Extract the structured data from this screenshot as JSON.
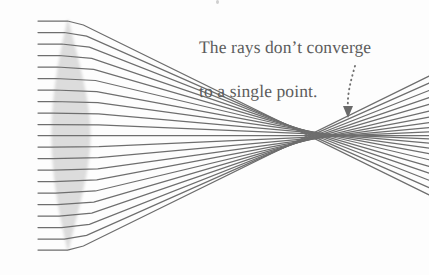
{
  "figure": {
    "annotation": {
      "line1": "The rays don’t converge",
      "line2": "to a single point.",
      "color": "#5c5c5c",
      "pointer_icon": "dotted-curved-arrow-icon"
    },
    "background_color": "#fdfdfd",
    "ray_color": "#6e6e6e",
    "lens_fill_color": "#dcdcdc",
    "lens_edge_color": "#c8c8c8",
    "width": 429,
    "height": 275
  },
  "chart_data": {
    "type": "scatter",
    "xlabel": "",
    "ylabel": "",
    "xlim": [
      0,
      429
    ],
    "ylim": [
      275,
      0
    ],
    "grid": false,
    "legend": null,
    "annotations": [
      {
        "text": "The rays don’t converge to a single point.",
        "x": 199,
        "y": 14,
        "arrow_from": [
          353,
          66
        ],
        "arrow_to": [
          348,
          116
        ],
        "arrow_style": "dotted-curved"
      }
    ],
    "optical_axis_y": 135.5,
    "lens": {
      "shape": "biconvex",
      "apex_top": [
        68,
        20
      ],
      "apex_bottom": [
        68,
        250
      ],
      "left_surface_vertex": [
        52,
        135
      ],
      "right_surface_vertex": [
        90,
        135
      ],
      "center_thickness": 38,
      "fill": "#dcdcdc"
    },
    "ray_start_x": 38,
    "ray_exit_x": 429,
    "rays": [
      {
        "height": 21.0,
        "entry_x": 67.6,
        "exit_x": 83.4,
        "focus_x": 311.0
      },
      {
        "height": 32.5,
        "entry_x": 64.4,
        "exit_x": 86.6,
        "focus_x": 314.0
      },
      {
        "height": 44.0,
        "entry_x": 61.6,
        "exit_x": 89.4,
        "focus_x": 317.5
      },
      {
        "height": 55.5,
        "entry_x": 59.2,
        "exit_x": 91.8,
        "focus_x": 321.0
      },
      {
        "height": 67.0,
        "entry_x": 57.2,
        "exit_x": 93.8,
        "focus_x": 325.0
      },
      {
        "height": 78.5,
        "entry_x": 55.5,
        "exit_x": 95.5,
        "focus_x": 329.5
      },
      {
        "height": 90.0,
        "entry_x": 54.2,
        "exit_x": 96.8,
        "focus_x": 334.0
      },
      {
        "height": 101.5,
        "entry_x": 53.2,
        "exit_x": 97.8,
        "focus_x": 339.0
      },
      {
        "height": 113.0,
        "entry_x": 52.5,
        "exit_x": 98.5,
        "focus_x": 344.5
      },
      {
        "height": 124.5,
        "entry_x": 52.1,
        "exit_x": 98.9,
        "focus_x": 350.0
      },
      {
        "height": 135.5,
        "entry_x": 52.0,
        "exit_x": 99.0,
        "focus_x": 355.0
      },
      {
        "height": 147.0,
        "entry_x": 52.1,
        "exit_x": 98.9,
        "focus_x": 350.0
      },
      {
        "height": 158.5,
        "entry_x": 52.5,
        "exit_x": 98.5,
        "focus_x": 344.5
      },
      {
        "height": 170.0,
        "entry_x": 53.2,
        "exit_x": 97.8,
        "focus_x": 339.0
      },
      {
        "height": 181.5,
        "entry_x": 54.2,
        "exit_x": 96.8,
        "focus_x": 334.0
      },
      {
        "height": 193.0,
        "entry_x": 55.5,
        "exit_x": 95.5,
        "focus_x": 329.5
      },
      {
        "height": 204.5,
        "entry_x": 57.2,
        "exit_x": 93.8,
        "focus_x": 325.0
      },
      {
        "height": 216.0,
        "entry_x": 59.2,
        "exit_x": 91.8,
        "focus_x": 321.0
      },
      {
        "height": 227.5,
        "entry_x": 61.6,
        "exit_x": 89.4,
        "focus_x": 317.5
      },
      {
        "height": 239.0,
        "entry_x": 64.4,
        "exit_x": 86.6,
        "focus_x": 314.0
      },
      {
        "height": 250.0,
        "entry_x": 67.6,
        "exit_x": 83.4,
        "focus_x": 311.0
      }
    ],
    "caustic_region": {
      "x_min": 305,
      "x_max": 360,
      "note": "rays cross over a range of axial points"
    }
  }
}
